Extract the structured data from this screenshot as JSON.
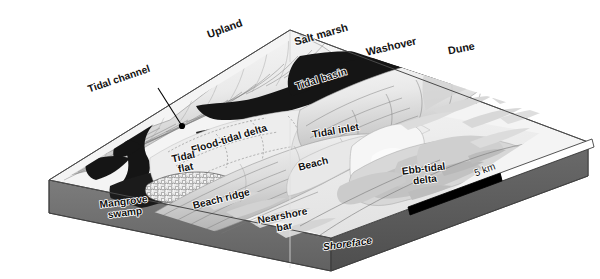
{
  "figure": {
    "scale_bar": {
      "label": "5 km",
      "segments": 2,
      "filled_color": "#000000",
      "empty_color": "#ffffff"
    },
    "palette": {
      "background": "#ffffff",
      "upland_light": "#f2f2f2",
      "upland_shadow": "#b9b9b9",
      "water_dark": "#1a1a1a",
      "tidal_flat": "#ececec",
      "beach_pale": "#f0f0f0",
      "sand_shoal": "#cfcfcf",
      "shoreface_light": "#e8e8e8",
      "block_side_gray": "#6e6e6e",
      "block_side_dark": "#4f4f4f",
      "outline": "#4a4a4a"
    }
  },
  "labels": [
    {
      "id": "upland",
      "text": "Upland",
      "x": 226,
      "y": 32,
      "rot": -20,
      "size": "lg",
      "style": "plain"
    },
    {
      "id": "salt-marsh",
      "text": "Salt marsh",
      "x": 322,
      "y": 38,
      "rot": -16,
      "size": "lg",
      "style": "plain"
    },
    {
      "id": "washover",
      "text": "Washover",
      "x": 392,
      "y": 50,
      "rot": -13,
      "size": "lg",
      "style": "plain"
    },
    {
      "id": "dune",
      "text": "Dune",
      "x": 462,
      "y": 52,
      "rot": -11,
      "size": "lg",
      "style": "plain"
    },
    {
      "id": "tidal-channel",
      "text": "Tidal channel",
      "x": 120,
      "y": 82,
      "rot": -19,
      "size": "md",
      "style": "plain"
    },
    {
      "id": "tidal-basin",
      "text": "Tidal basin",
      "x": 322,
      "y": 82,
      "rot": -17,
      "size": "md",
      "style": "plain"
    },
    {
      "id": "flood-tidal-delta",
      "text": "Flood-tidal delta",
      "x": 230,
      "y": 142,
      "rot": -17,
      "size": "md",
      "style": "plain"
    },
    {
      "id": "tidal-inlet",
      "text": "Tidal inlet",
      "x": 336,
      "y": 134,
      "rot": -10,
      "size": "md",
      "style": "plain"
    },
    {
      "id": "tidal-flat",
      "text": "Tidal\nflat",
      "x": 184,
      "y": 160,
      "rot": -12,
      "size": "md",
      "style": "plain"
    },
    {
      "id": "beach",
      "text": "Beach",
      "x": 314,
      "y": 167,
      "rot": -14,
      "size": "md",
      "style": "plain"
    },
    {
      "id": "ebb-tidal-delta",
      "text": "Ebb-tidal\ndelta",
      "x": 424,
      "y": 172,
      "rot": -7,
      "size": "md",
      "style": "plain"
    },
    {
      "id": "beach-ridge",
      "text": "Beach ridge",
      "x": 222,
      "y": 202,
      "rot": -14,
      "size": "md",
      "style": "plain"
    },
    {
      "id": "mangrove-swamp",
      "text": "Mangrove\nswamp",
      "x": 124,
      "y": 205,
      "rot": -7,
      "size": "md",
      "style": "plain"
    },
    {
      "id": "nearshore-bar",
      "text": "Nearshore\nbar",
      "x": 283,
      "y": 219,
      "rot": -11,
      "size": "md",
      "style": "plain"
    },
    {
      "id": "shoreface",
      "text": "Shoreface",
      "x": 348,
      "y": 247,
      "rot": -8,
      "size": "md",
      "style": "ital"
    }
  ],
  "leader": {
    "id": "tidal-channel-leader",
    "from_x": 158,
    "from_y": 88,
    "to_x": 182,
    "to_y": 126,
    "dot_r": 3.1
  },
  "legend_units": [
    "km"
  ]
}
